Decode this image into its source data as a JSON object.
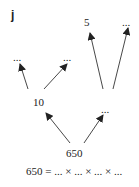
{
  "panel_label": "j",
  "nodes": {
    "root": "650",
    "mid_left": "10",
    "mid_right": "...",
    "leaf_ll": "...",
    "leaf_lr": "...",
    "leaf_rl": "5",
    "leaf_rr": "..."
  },
  "equation": "650 = ... × ... × ... × ...",
  "colors": {
    "ink": "#222222",
    "background": "#ffffff"
  }
}
